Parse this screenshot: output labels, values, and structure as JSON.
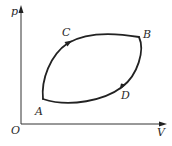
{
  "diagram": {
    "type": "P-V cycle",
    "axes": {
      "y_label": "p",
      "x_label": "V",
      "origin_label": "O"
    },
    "points": [
      {
        "id": "A",
        "label": "A"
      },
      {
        "id": "C",
        "label": "C"
      },
      {
        "id": "B",
        "label": "B"
      },
      {
        "id": "D",
        "label": "D"
      }
    ],
    "cycle_direction": [
      "A",
      "C",
      "B",
      "D",
      "A"
    ],
    "colors": {
      "line": "#222222",
      "axis": "#333333",
      "text": "#2a2a2a",
      "background": "#ffffff"
    }
  }
}
